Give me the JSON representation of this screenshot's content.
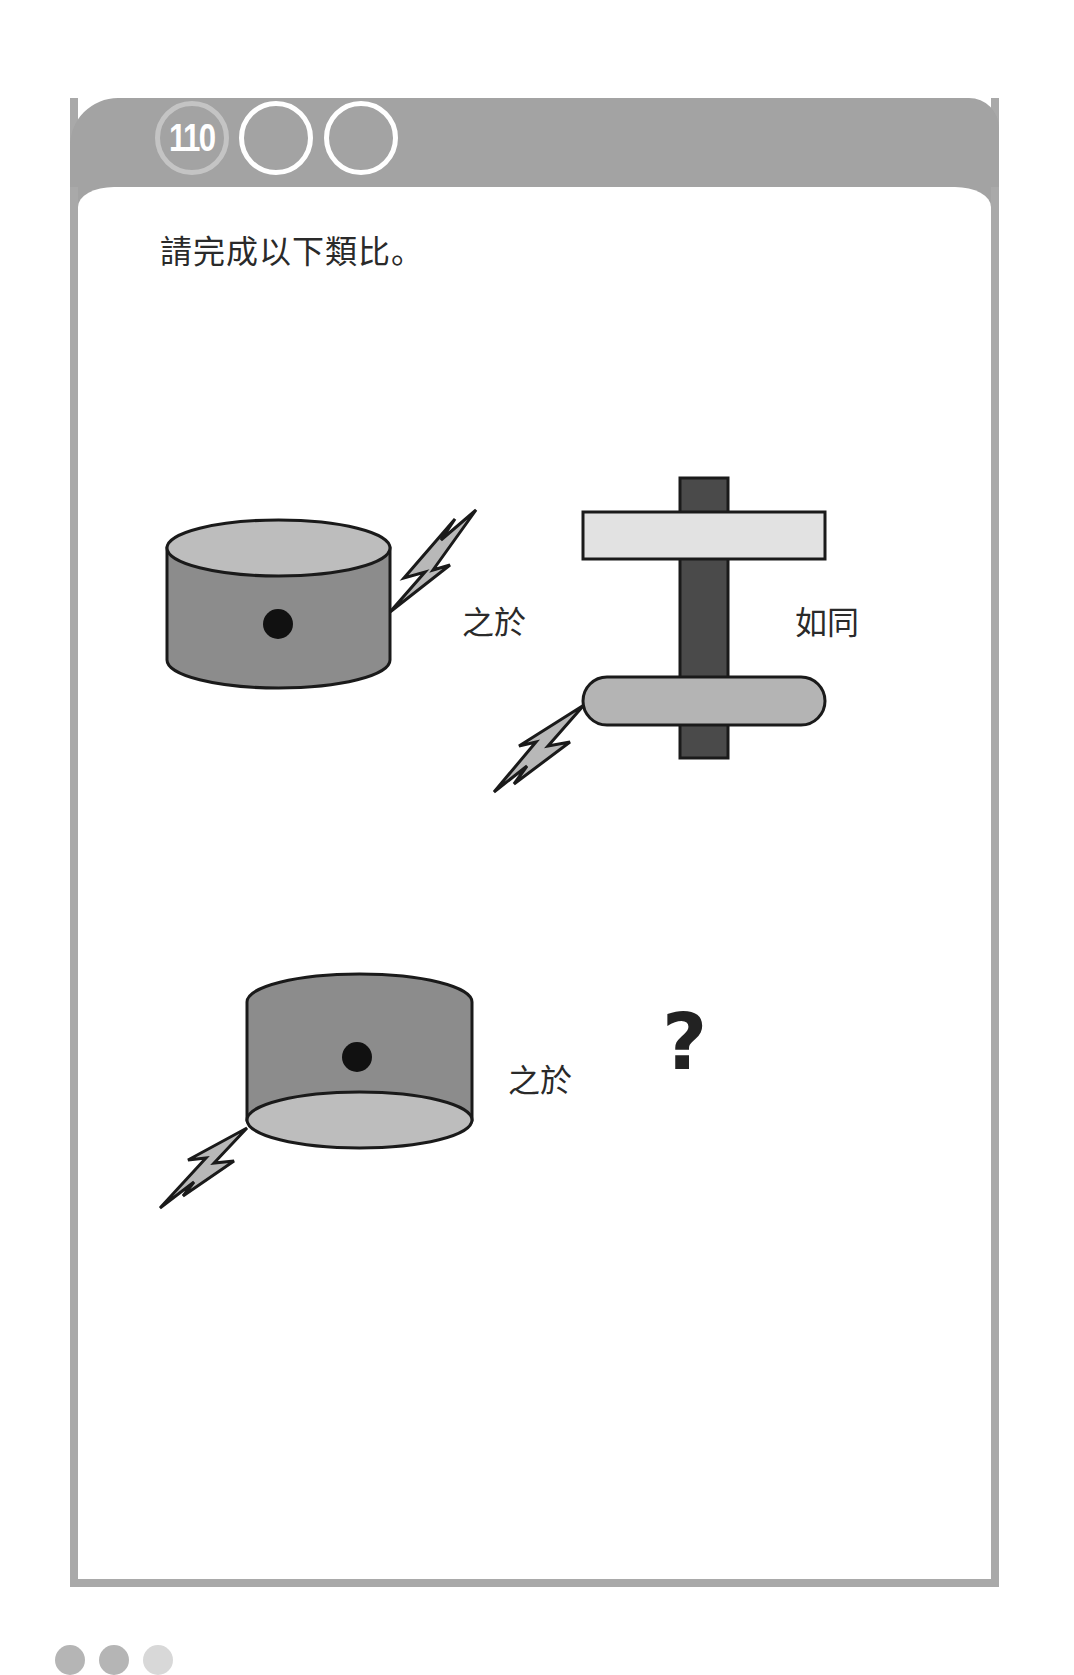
{
  "header": {
    "puzzle_number": "110",
    "blank_circles": 2
  },
  "instruction": "請完成以下類比。",
  "analogy": {
    "row1": {
      "left_figure": "cylinder-with-dot-top-view-with-bolt",
      "relation_label": "之於",
      "right_figure": "post-with-plank-and-pill-with-bolt",
      "connector_label": "如同"
    },
    "row2": {
      "left_figure": "cylinder-with-dot-bottom-view-with-bolt",
      "relation_label": "之於",
      "answer": "?"
    }
  },
  "colors": {
    "header_bar": "#a3a3a3",
    "frame_border": "#a9a9a9",
    "cylinder_body": "#8c8c8c",
    "cylinder_face": "#bdbdbd",
    "plank": "#e2e2e2",
    "post": "#4a4a4a",
    "pill": "#b4b4b4",
    "bolt": "#b8b8b8"
  }
}
